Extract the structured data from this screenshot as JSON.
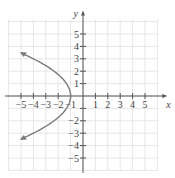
{
  "chart_data": {
    "type": "line",
    "title": "",
    "xlabel": "x",
    "ylabel": "y",
    "xlim": [
      -6,
      6
    ],
    "ylim": [
      -6,
      6
    ],
    "grid": true,
    "x_ticks": [
      "−5",
      "−4",
      "−3",
      "−2",
      "−1",
      "1",
      "2",
      "3",
      "4",
      "5"
    ],
    "y_ticks": [
      "5",
      "4",
      "3",
      "2",
      "1",
      "−2",
      "−3",
      "−4",
      "−5"
    ],
    "series": [
      {
        "name": "x = -(1/3)y^2 - 1",
        "description": "Parabola opening left with vertex at (-1, 0), arrows at both ends",
        "vertex": [
          -1,
          0
        ],
        "points": [
          [
            -5.0,
            3.46
          ],
          [
            -4,
            3
          ],
          [
            -2.33,
            2
          ],
          [
            -1.33,
            1
          ],
          [
            -1,
            0
          ],
          [
            -1.33,
            -1
          ],
          [
            -2.33,
            -2
          ],
          [
            -4,
            -3
          ],
          [
            -5.0,
            -3.46
          ]
        ]
      }
    ],
    "colors": {
      "curve": "#7a7a7a",
      "axes": "#555555",
      "grid": "#e6e6e6"
    }
  }
}
